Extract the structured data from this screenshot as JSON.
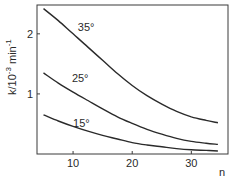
{
  "chart_data": {
    "type": "line",
    "title": "",
    "xlabel": "n",
    "ylabel": "k/10^-3 min^-1",
    "ylabel_parts": {
      "base": "k/10",
      "exp": "-3",
      "unit": " min",
      "unit_exp": "-1"
    },
    "xlim": [
      3.9,
      36.2
    ],
    "ylim": [
      0,
      2.48
    ],
    "x_ticks": [
      10,
      20,
      30
    ],
    "x_tick_labels": [
      "10",
      "20",
      "30"
    ],
    "y_ticks": [
      1,
      2
    ],
    "y_tick_labels": [
      "1",
      "2"
    ],
    "grid": false,
    "legend": "none (inline curve labels)",
    "series": [
      {
        "name": "35°",
        "label": "35°",
        "label_pos": {
          "n": 10.8,
          "k": 2.05
        },
        "x": [
          5,
          7.5,
          10,
          12.5,
          15,
          17.5,
          20,
          22.5,
          25,
          27.5,
          30,
          32.5,
          34.5
        ],
        "values": [
          2.42,
          2.22,
          2.0,
          1.78,
          1.56,
          1.34,
          1.14,
          0.97,
          0.83,
          0.71,
          0.62,
          0.56,
          0.52
        ]
      },
      {
        "name": "25°",
        "label": "25°",
        "label_pos": {
          "n": 9.8,
          "k": 1.2
        },
        "x": [
          5,
          7.5,
          10,
          12.5,
          15,
          17.5,
          20,
          22.5,
          25,
          27.5,
          30,
          32.5,
          34.5
        ],
        "values": [
          1.35,
          1.18,
          1.03,
          0.89,
          0.75,
          0.62,
          0.51,
          0.41,
          0.33,
          0.26,
          0.21,
          0.18,
          0.16
        ]
      },
      {
        "name": "15°",
        "label": "15°",
        "label_pos": {
          "n": 10.0,
          "k": 0.45
        },
        "x": [
          5,
          7.5,
          10,
          12.5,
          15,
          17.5,
          20,
          22.5,
          25,
          27.5,
          30,
          32.5,
          34.5
        ],
        "values": [
          0.65,
          0.55,
          0.46,
          0.38,
          0.31,
          0.25,
          0.19,
          0.15,
          0.12,
          0.09,
          0.07,
          0.06,
          0.05
        ]
      }
    ]
  },
  "style": {
    "line_color": "#2a2a2a",
    "axis_color": "#3a3a3a",
    "background": "#ffffff"
  }
}
